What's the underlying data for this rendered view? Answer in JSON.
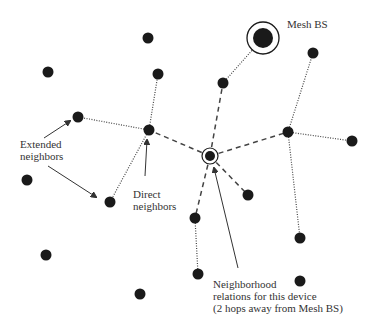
{
  "diagram": {
    "type": "mesh-network",
    "colors": {
      "node": "#1a1a1a",
      "line": "#444444",
      "text": "#333333",
      "background": "#ffffff"
    },
    "labels": {
      "mesh_bs": "Mesh BS",
      "extended_line1": "Extended",
      "extended_line2": "neighbors",
      "direct_line1": "Direct",
      "direct_line2": "neighbors",
      "neighborhood_line1": "Neighborhood",
      "neighborhood_line2": "relations for this device",
      "neighborhood_line3": "(2 hops away from Mesh BS)"
    },
    "nodes": [
      {
        "id": "mesh-bs",
        "x": 263,
        "y": 38,
        "kind": "base-station"
      },
      {
        "id": "device",
        "x": 210,
        "y": 156,
        "kind": "this-device"
      },
      {
        "id": "n1",
        "x": 148,
        "y": 38
      },
      {
        "id": "n2",
        "x": 48,
        "y": 72
      },
      {
        "id": "n3",
        "x": 158,
        "y": 74
      },
      {
        "id": "n4",
        "x": 223,
        "y": 83
      },
      {
        "id": "n5",
        "x": 313,
        "y": 53
      },
      {
        "id": "n6",
        "x": 78,
        "y": 117
      },
      {
        "id": "n7",
        "x": 149,
        "y": 130
      },
      {
        "id": "n8",
        "x": 288,
        "y": 132
      },
      {
        "id": "n9",
        "x": 352,
        "y": 141
      },
      {
        "id": "n10",
        "x": 27,
        "y": 180
      },
      {
        "id": "n11",
        "x": 110,
        "y": 202
      },
      {
        "id": "n12",
        "x": 248,
        "y": 195
      },
      {
        "id": "n13",
        "x": 195,
        "y": 218
      },
      {
        "id": "n14",
        "x": 300,
        "y": 238
      },
      {
        "id": "n15",
        "x": 46,
        "y": 255
      },
      {
        "id": "n16",
        "x": 198,
        "y": 274
      },
      {
        "id": "n17",
        "x": 300,
        "y": 281
      },
      {
        "id": "n18",
        "x": 140,
        "y": 294
      }
    ],
    "edges": [
      {
        "from": "device",
        "to": "n4",
        "style": "dashed"
      },
      {
        "from": "device",
        "to": "n7",
        "style": "dashed"
      },
      {
        "from": "device",
        "to": "n8",
        "style": "dashed"
      },
      {
        "from": "device",
        "to": "n12",
        "style": "dashed"
      },
      {
        "from": "device",
        "to": "n13",
        "style": "dashed"
      },
      {
        "from": "n4",
        "to": "mesh-bs",
        "style": "dotted"
      },
      {
        "from": "n7",
        "to": "n6",
        "style": "dotted"
      },
      {
        "from": "n7",
        "to": "n3",
        "style": "dotted"
      },
      {
        "from": "n7",
        "to": "n11",
        "style": "dotted"
      },
      {
        "from": "n8",
        "to": "n5",
        "style": "dotted"
      },
      {
        "from": "n8",
        "to": "n9",
        "style": "dotted"
      },
      {
        "from": "n8",
        "to": "n14",
        "style": "dotted"
      },
      {
        "from": "n13",
        "to": "n16",
        "style": "dotted"
      }
    ]
  }
}
